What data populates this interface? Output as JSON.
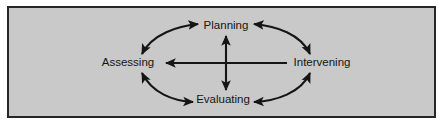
{
  "figure": {
    "type": "cycle-diagram",
    "background_color": "#ffffff",
    "panel_color": "#c9c9c9",
    "border_color": "#262626",
    "stroke_color": "#151515",
    "text_color": "#151515"
  },
  "nodes": [
    {
      "id": "planning",
      "label": "Planning",
      "position": "top"
    },
    {
      "id": "assessing",
      "label": "Assessing",
      "position": "left"
    },
    {
      "id": "intervening",
      "label": "Intervening",
      "position": "right"
    },
    {
      "id": "evaluating",
      "label": "Evaluating",
      "position": "bottom"
    }
  ],
  "connectors": [
    {
      "id": "arc-assessing-planning",
      "from": "Assessing",
      "to": "Planning",
      "style": "curved",
      "heads": "both"
    },
    {
      "id": "arc-planning-intervening",
      "from": "Planning",
      "to": "Intervening",
      "style": "curved",
      "heads": "both"
    },
    {
      "id": "arc-intervening-evaluating",
      "from": "Intervening",
      "to": "Evaluating",
      "style": "curved",
      "heads": "both"
    },
    {
      "id": "arc-evaluating-assessing",
      "from": "Evaluating",
      "to": "Assessing",
      "style": "curved",
      "heads": "both"
    },
    {
      "id": "axis-vertical",
      "from": "Evaluating",
      "to": "Planning",
      "style": "straight",
      "heads": "both"
    },
    {
      "id": "axis-horizontal",
      "from": "Intervening",
      "to": "Assessing",
      "style": "straight",
      "heads": "start"
    }
  ]
}
